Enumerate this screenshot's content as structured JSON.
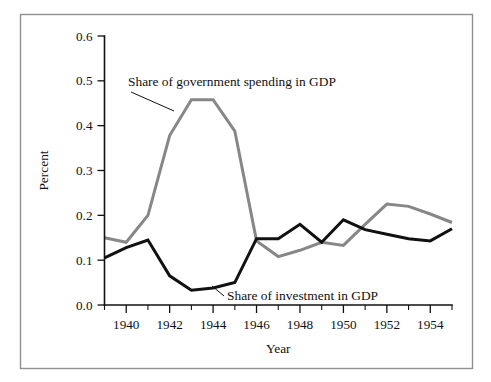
{
  "figure": {
    "width": 491,
    "height": 382,
    "background": "#ffffff",
    "frame_color": "#8d8f91"
  },
  "chart_data": {
    "type": "line",
    "title": "",
    "subtitle": "",
    "xlabel": "Year",
    "ylabel": "Percent",
    "xlim": [
      1939,
      1955
    ],
    "ylim": [
      0.0,
      0.6
    ],
    "grid": false,
    "legend_position": "inline-annotations",
    "x_tick_labels": [
      "1940",
      "1942",
      "1944",
      "1946",
      "1948",
      "1950",
      "1952",
      "1954"
    ],
    "x_tick_values": [
      1940,
      1942,
      1944,
      1946,
      1948,
      1950,
      1952,
      1954
    ],
    "x_minor_tick_values": [
      1939,
      1941,
      1943,
      1945,
      1947,
      1949,
      1951,
      1953,
      1955
    ],
    "y_tick_labels": [
      "0.0",
      "0.1",
      "0.2",
      "0.3",
      "0.4",
      "0.5",
      "0.6"
    ],
    "y_tick_values": [
      0.0,
      0.1,
      0.2,
      0.3,
      0.4,
      0.5,
      0.6
    ],
    "x": [
      1939,
      1940,
      1941,
      1942,
      1943,
      1944,
      1945,
      1946,
      1947,
      1948,
      1949,
      1950,
      1951,
      1952,
      1953,
      1954,
      1955
    ],
    "series": [
      {
        "name": "Share of government spending in GDP",
        "color": "#878787",
        "width": 3.0,
        "values": [
          0.15,
          0.14,
          0.2,
          0.378,
          0.458,
          0.458,
          0.388,
          0.143,
          0.108,
          0.122,
          0.14,
          0.133,
          0.18,
          0.225,
          0.22,
          0.203,
          0.184
        ]
      },
      {
        "name": "Share of investment in GDP",
        "color": "#111111",
        "width": 3.0,
        "values": [
          0.105,
          0.128,
          0.145,
          0.065,
          0.033,
          0.038,
          0.05,
          0.148,
          0.148,
          0.18,
          0.14,
          0.19,
          0.168,
          0.158,
          0.148,
          0.143,
          0.17
        ]
      }
    ],
    "annotations": [
      {
        "name": "government-spending-annotation",
        "text": "Share of government spending in GDP",
        "text_x": 128,
        "text_y": 86,
        "leader_from_x": 131,
        "leader_from_y": 92,
        "leader_to_x": 174,
        "leader_to_y": 111
      },
      {
        "name": "investment-annotation",
        "text": "Share of investment in GDP",
        "text_x": 227,
        "text_y": 300,
        "leader_from_x": 224,
        "leader_from_y": 296,
        "leader_to_x": 212,
        "leader_to_y": 286
      }
    ]
  }
}
